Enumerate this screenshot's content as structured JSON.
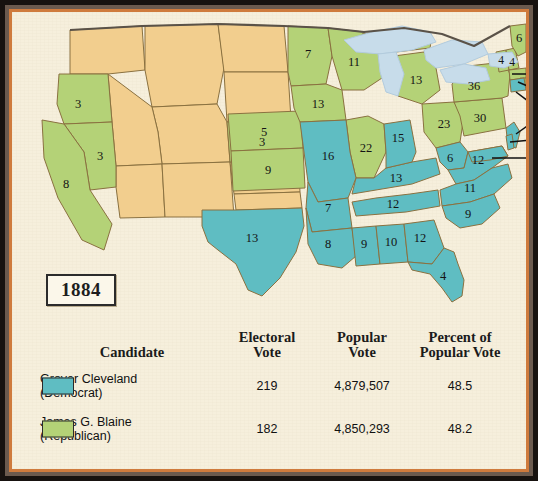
{
  "year_box": {
    "label": "1884"
  },
  "map": {
    "title_year": "1884",
    "colors": {
      "democrat": "#5fbdc2",
      "republican": "#b4d277",
      "territory": "#f2ce8e",
      "lake": "#c7dcea",
      "paper": "#f6efdc",
      "border": "#8a7140",
      "text": "#141414"
    },
    "states": [
      {
        "name": "Oregon",
        "abbr": "OR",
        "votes": "3",
        "party": "republican"
      },
      {
        "name": "Nevada",
        "abbr": "NV",
        "votes": "3",
        "party": "republican"
      },
      {
        "name": "California",
        "abbr": "CA",
        "votes": "8",
        "party": "republican"
      },
      {
        "name": "Colorado",
        "abbr": "CO",
        "votes": "3",
        "party": "republican"
      },
      {
        "name": "Nebraska",
        "abbr": "NE",
        "votes": "5",
        "party": "republican"
      },
      {
        "name": "Kansas",
        "abbr": "KS",
        "votes": "9",
        "party": "republican"
      },
      {
        "name": "Minnesota",
        "abbr": "MN",
        "votes": "7",
        "party": "republican"
      },
      {
        "name": "Iowa",
        "abbr": "IA",
        "votes": "13",
        "party": "republican"
      },
      {
        "name": "Wisconsin",
        "abbr": "WI",
        "votes": "11",
        "party": "republican"
      },
      {
        "name": "Michigan",
        "abbr": "MI",
        "votes": "13",
        "party": "republican"
      },
      {
        "name": "Illinois",
        "abbr": "IL",
        "votes": "22",
        "party": "republican"
      },
      {
        "name": "Ohio",
        "abbr": "OH",
        "votes": "23",
        "party": "republican"
      },
      {
        "name": "Pennsylvania",
        "abbr": "PA",
        "votes": "30",
        "party": "republican"
      },
      {
        "name": "Vermont",
        "abbr": "VT",
        "votes": "4",
        "party": "republican"
      },
      {
        "name": "New Hampshire",
        "abbr": "NH",
        "votes": "4",
        "party": "republican"
      },
      {
        "name": "Maine",
        "abbr": "ME",
        "votes": "6",
        "party": "republican"
      },
      {
        "name": "Massachusetts",
        "abbr": "MA",
        "votes": "14",
        "party": "republican"
      },
      {
        "name": "Rhode Island",
        "abbr": "RI",
        "votes": "4",
        "party": "republican"
      },
      {
        "name": "Indiana",
        "abbr": "IN",
        "votes": "15",
        "party": "democrat"
      },
      {
        "name": "Missouri",
        "abbr": "MO",
        "votes": "16",
        "party": "democrat"
      },
      {
        "name": "Arkansas",
        "abbr": "AR",
        "votes": "7",
        "party": "democrat"
      },
      {
        "name": "Texas",
        "abbr": "TX",
        "votes": "13",
        "party": "democrat"
      },
      {
        "name": "Louisiana",
        "abbr": "LA",
        "votes": "8",
        "party": "democrat"
      },
      {
        "name": "Mississippi",
        "abbr": "MS",
        "votes": "9",
        "party": "democrat"
      },
      {
        "name": "Alabama",
        "abbr": "AL",
        "votes": "10",
        "party": "democrat"
      },
      {
        "name": "Georgia",
        "abbr": "GA",
        "votes": "12",
        "party": "democrat"
      },
      {
        "name": "Florida",
        "abbr": "FL",
        "votes": "4",
        "party": "democrat"
      },
      {
        "name": "Tennessee",
        "abbr": "TN",
        "votes": "12",
        "party": "democrat"
      },
      {
        "name": "Kentucky",
        "abbr": "KY",
        "votes": "13",
        "party": "democrat"
      },
      {
        "name": "West Virginia",
        "abbr": "WV",
        "votes": "6",
        "party": "democrat"
      },
      {
        "name": "Virginia",
        "abbr": "VA",
        "votes": "12",
        "party": "democrat"
      },
      {
        "name": "North Carolina",
        "abbr": "NC",
        "votes": "11",
        "party": "democrat"
      },
      {
        "name": "South Carolina",
        "abbr": "SC",
        "votes": "9",
        "party": "democrat"
      },
      {
        "name": "New York",
        "abbr": "NY",
        "votes": "36",
        "party": "democrat"
      },
      {
        "name": "New Jersey",
        "abbr": "NJ",
        "votes": "9",
        "party": "democrat"
      },
      {
        "name": "Connecticut",
        "abbr": "CT",
        "votes": "6",
        "party": "democrat"
      },
      {
        "name": "Delaware",
        "abbr": "DE",
        "votes": "3",
        "party": "democrat"
      },
      {
        "name": "Maryland",
        "abbr": "MD",
        "votes": "8",
        "party": "democrat"
      }
    ],
    "callout_labels": [
      "14",
      "4",
      "6",
      "9",
      "3",
      "8"
    ]
  },
  "table": {
    "headers": {
      "candidate": "Candidate",
      "electoral_line1": "Electoral",
      "electoral_line2": "Vote",
      "popular_line1": "Popular",
      "popular_line2": "Vote",
      "percent_line1": "Percent of",
      "percent_line2": "Popular Vote"
    },
    "rows": [
      {
        "name_line1": "Grover Cleveland",
        "name_line2": "(Democrat)",
        "electoral_vote": "219",
        "popular_vote": "4,879,507",
        "percent": "48.5",
        "swatch_color": "#5fbdc2"
      },
      {
        "name_line1": "James G. Blaine",
        "name_line2": "(Republican)",
        "electoral_vote": "182",
        "popular_vote": "4,850,293",
        "percent": "48.2",
        "swatch_color": "#b4d277"
      }
    ]
  }
}
